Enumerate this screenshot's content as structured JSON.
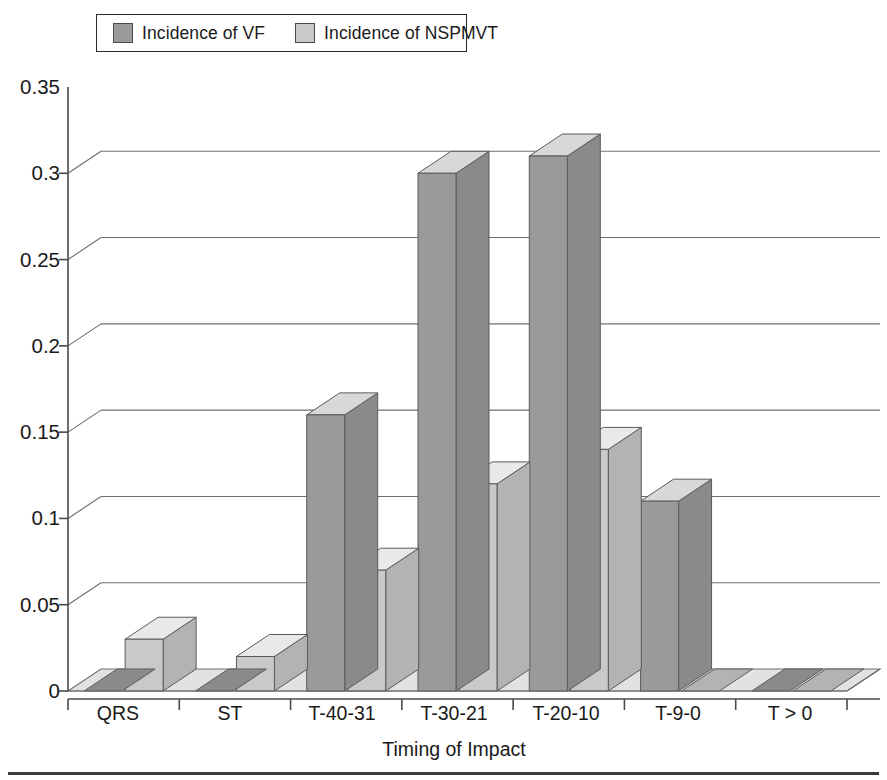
{
  "legend": {
    "position": "top",
    "entries": [
      {
        "label": "Incidence of VF",
        "swatch": "vf",
        "color": "#9a9a9a"
      },
      {
        "label": "Incidence of NSPMVT",
        "swatch": "nspmvt",
        "color": "#c9c9c9"
      }
    ]
  },
  "axes": {
    "y_ticks": [
      "0.35",
      "0.3",
      "0.25",
      "0.2",
      "0.15",
      "0.1",
      "0.05",
      "0"
    ],
    "x_title": "Timing of Impact",
    "y_title": ""
  },
  "style": {
    "series_vf_face": "#9a9a9a",
    "series_vf_top": "#d8d8d8",
    "series_vf_side": "#8a8a8a",
    "series_nspmvt_face": "#c9c9c9",
    "series_nspmvt_top": "#e9e9e9",
    "series_nspmvt_side": "#b3b3b3",
    "floor": "#e2e2e2",
    "gridline": "#6f6f6f",
    "axis": "#4a4a4a",
    "text": "#1a1a1a"
  },
  "chart_data": {
    "type": "bar",
    "title": "",
    "xlabel": "Timing of Impact",
    "ylabel": "",
    "ylim": [
      0,
      0.35
    ],
    "ytick_step": 0.05,
    "grid": true,
    "three_d": true,
    "legend_position": "top",
    "categories": [
      "QRS",
      "ST",
      "T-40-31",
      "T-30-21",
      "T-20-10",
      "T-9-0",
      "T > 0"
    ],
    "series": [
      {
        "name": "Incidence of VF",
        "color": "#9a9a9a",
        "values": [
          0.0,
          0.0,
          0.16,
          0.3,
          0.31,
          0.11,
          0.0
        ]
      },
      {
        "name": "Incidence of NSPMVT",
        "color": "#c9c9c9",
        "values": [
          0.03,
          0.02,
          0.07,
          0.12,
          0.14,
          0.0,
          0.0
        ]
      }
    ]
  }
}
